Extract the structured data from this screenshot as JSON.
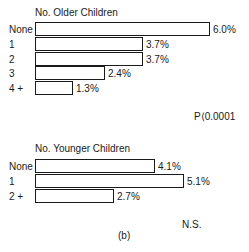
{
  "chart_data": [
    {
      "type": "bar",
      "orientation": "horizontal",
      "title": "No. Older Children",
      "categories": [
        "None",
        "1",
        "2",
        "3",
        "4 +"
      ],
      "values": [
        6.0,
        3.7,
        3.7,
        2.4,
        1.3
      ],
      "value_labels": [
        "6.0%",
        "3.7%",
        "3.7%",
        "2.4%",
        "1.3%"
      ],
      "unit": "%",
      "significance": "P⟨0.0001",
      "grid": false,
      "xlim": [
        0,
        6.0
      ]
    },
    {
      "type": "bar",
      "orientation": "horizontal",
      "title": "No. Younger Children",
      "categories": [
        "None",
        "1",
        "2 +"
      ],
      "values": [
        4.1,
        5.1,
        2.7
      ],
      "value_labels": [
        "4.1%",
        "5.1%",
        "2.7%"
      ],
      "unit": "%",
      "significance": "N.S.",
      "grid": false,
      "xlim": [
        0,
        6.0
      ]
    }
  ],
  "caption": "(b)",
  "colors": {
    "bar_fill": "#ffffff",
    "bar_border": "#1a1a1a",
    "text": "#1a1a1a"
  }
}
